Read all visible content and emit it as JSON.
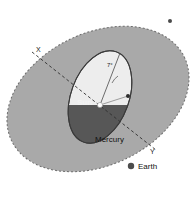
{
  "figure": {
    "background_color": "#ffffff",
    "ecliptic_plane": {
      "name": "ecliptic-plane-disc",
      "fill_color": "#a9a9a9",
      "edge_style": "dashed",
      "edge_color": "#6e6e6e",
      "center_x": 98,
      "center_y": 99,
      "radius_x": 96,
      "radius_y": 66,
      "rotation_deg": -26
    },
    "mercury_orbit_plane": {
      "name": "mercury-orbit-disc",
      "light_half_color": "#ededed",
      "dark_half_color": "#575757",
      "edge_color": "#3a3a3a",
      "center_x": 100,
      "center_y": 97,
      "radius_x": 29,
      "radius_y": 48,
      "rotation_deg": 20
    },
    "node_line": {
      "name": "line-of-nodes",
      "style": "dashed",
      "color": "#3a3a3a",
      "from_x": 32,
      "from_y": 52,
      "to_x": 156,
      "to_y": 150
    }
  },
  "labels": {
    "node_ascending": "X",
    "node_descending": "Y",
    "sun": "Sun",
    "mercury": "Mercury",
    "earth": "Earth",
    "inclination_angle": "7°"
  },
  "markers": {
    "sun_dot": {
      "name": "sun-marker",
      "x": 100,
      "y": 105,
      "color": "#fcfcfc",
      "size": 5
    },
    "earth_dot": {
      "name": "earth-marker",
      "x": 131,
      "y": 166,
      "color": "#4c4c4c",
      "size": 6
    },
    "mercury_dot": {
      "name": "mercury-marker",
      "x": 128,
      "y": 96,
      "color": "#2e2e2e",
      "size": 4
    },
    "ecliptic_dot": {
      "name": "ecliptic-edge-marker",
      "x": 170,
      "y": 21,
      "color": "#4a4a4a",
      "size": 4
    }
  },
  "colors": {
    "plane_gray": "#a9a9a9",
    "orbit_light": "#ededed",
    "orbit_dark": "#575757",
    "line_dark": "#3a3a3a",
    "background": "#ffffff"
  }
}
